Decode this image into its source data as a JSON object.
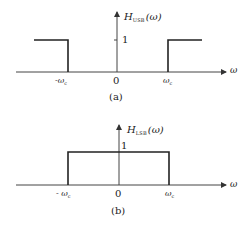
{
  "figure_a": {
    "ylabel_main": "H",
    "ylabel_sub": "USB",
    "ylabel_arg": "(ω)",
    "level_label": "1",
    "origin_label": "0",
    "neg_cutoff_label": "-ω",
    "neg_cutoff_sub": "c",
    "pos_cutoff_label": "ω",
    "pos_cutoff_sub": "c",
    "xlabel": "ω",
    "caption": "(a)",
    "description": "High-pass: H=1 for |ω|>ωc, 0 otherwise"
  },
  "figure_b": {
    "ylabel_main": "H",
    "ylabel_sub": "LSB",
    "ylabel_arg": "(ω)",
    "level_label": "1",
    "origin_label": "0",
    "neg_cutoff_label": "- ω",
    "neg_cutoff_sub": "c",
    "pos_cutoff_label": "ω",
    "pos_cutoff_sub": "c",
    "xlabel": "ω",
    "caption": "(b)",
    "description": "Low-pass: H=1 for |ω|<ωc, 0 otherwise"
  },
  "colors": {
    "line": "#222222",
    "axis": "#444444"
  }
}
